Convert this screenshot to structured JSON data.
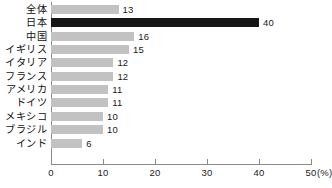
{
  "chart_data": {
    "type": "bar",
    "orientation": "horizontal",
    "title": "",
    "xlabel": "(%)",
    "ylabel": "",
    "xlim": [
      0,
      50
    ],
    "xticks": [
      0,
      10,
      20,
      30,
      40,
      50
    ],
    "xtick_labels": [
      "0",
      "10",
      "20",
      "30",
      "40",
      "50"
    ],
    "unit_label": "(%)",
    "grid": false,
    "legend": false,
    "categories": [
      "全体",
      "日本",
      "中国",
      "イギリス",
      "イタリア",
      "フランス",
      "アメリカ",
      "ドイツ",
      "メキシコ",
      "ブラジル",
      "インド"
    ],
    "values": [
      13,
      40,
      16,
      15,
      12,
      12,
      11,
      11,
      10,
      10,
      6
    ],
    "value_labels": [
      "13",
      "40",
      "16",
      "15",
      "12",
      "12",
      "11",
      "11",
      "10",
      "10",
      "6"
    ],
    "highlight_index": 1,
    "colors": {
      "bar": "#c2c2c2",
      "bar_highlight": "#161616",
      "axis": "#8a8a8a",
      "text": "#1a1a1a",
      "background": "#ffffff"
    }
  }
}
